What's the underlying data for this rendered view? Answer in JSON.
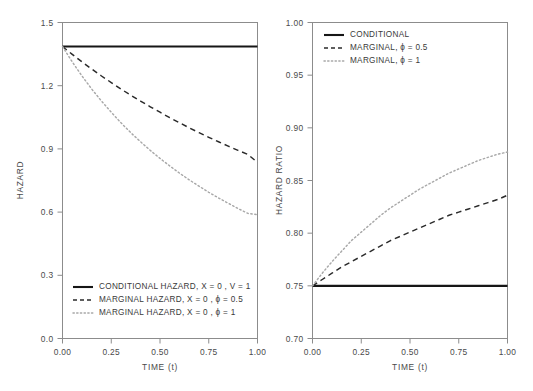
{
  "figure": {
    "background": "#ffffff",
    "panel_count": 2
  },
  "chart_data": [
    {
      "type": "line",
      "panel": "left",
      "title": "",
      "xlabel": "TIME (t)",
      "ylabel": "HAZARD",
      "xlim": [
        0,
        1
      ],
      "ylim": [
        0,
        1.5
      ],
      "xticks": [
        "0.00",
        "0.25",
        "0.50",
        "0.75",
        "1.00"
      ],
      "xtick_values": [
        0,
        0.25,
        0.5,
        0.75,
        1
      ],
      "yticks": [
        "0.0",
        "0.3",
        "0.6",
        "0.9",
        "1.2",
        "1.5"
      ],
      "ytick_values": [
        0,
        0.3,
        0.6,
        0.9,
        1.2,
        1.5
      ],
      "grid": false,
      "legend_position": "bottom-left-inside",
      "x": [
        0,
        0.05,
        0.1,
        0.15,
        0.2,
        0.25,
        0.3,
        0.35,
        0.4,
        0.45,
        0.5,
        0.55,
        0.6,
        0.65,
        0.7,
        0.75,
        0.8,
        0.85,
        0.9,
        0.95,
        1.0
      ],
      "series": [
        {
          "name": "CONDITIONAL HAZARD, X = 0 , V = 1",
          "style": "solid",
          "color": "#161616",
          "values": [
            1.386,
            1.386,
            1.386,
            1.386,
            1.386,
            1.386,
            1.386,
            1.386,
            1.386,
            1.386,
            1.386,
            1.386,
            1.386,
            1.386,
            1.386,
            1.386,
            1.386,
            1.386,
            1.386,
            1.386,
            1.386
          ]
        },
        {
          "name": "MARGINAL HAZARD, X = 0 , ϕ = 0.5",
          "style": "dashed",
          "color": "#2a2a2a",
          "values": [
            1.386,
            1.349,
            1.313,
            1.279,
            1.246,
            1.215,
            1.184,
            1.155,
            1.127,
            1.1,
            1.074,
            1.048,
            1.024,
            1.0,
            0.977,
            0.955,
            0.934,
            0.913,
            0.893,
            0.874,
            0.836
          ]
        },
        {
          "name": "MARGINAL HAZARD, X = 0 , ϕ = 1",
          "style": "dotted",
          "color": "#a8a8a8",
          "values": [
            1.386,
            1.313,
            1.246,
            1.184,
            1.127,
            1.074,
            1.024,
            0.977,
            0.934,
            0.893,
            0.855,
            0.819,
            0.785,
            0.753,
            0.723,
            0.694,
            0.667,
            0.642,
            0.617,
            0.594,
            0.588
          ]
        }
      ],
      "legend": [
        {
          "label": "CONDITIONAL HAZARD, X = 0 , V = 1",
          "style": "solid"
        },
        {
          "label": "MARGINAL HAZARD, X = 0 , ϕ = 0.5",
          "style": "dashed"
        },
        {
          "label": "MARGINAL HAZARD, X = 0 , ϕ = 1",
          "style": "dotted"
        }
      ]
    },
    {
      "type": "line",
      "panel": "right",
      "title": "",
      "xlabel": "TIME (t)",
      "ylabel": "HAZARD RATIO",
      "xlim": [
        0,
        1
      ],
      "ylim": [
        0.7,
        1.0
      ],
      "xticks": [
        "0.00",
        "0.25",
        "0.50",
        "0.75",
        "1.00"
      ],
      "xtick_values": [
        0,
        0.25,
        0.5,
        0.75,
        1
      ],
      "yticks": [
        "0.70",
        "0.75",
        "0.80",
        "0.85",
        "0.90",
        "0.95",
        "1.00"
      ],
      "ytick_values": [
        0.7,
        0.75,
        0.8,
        0.85,
        0.9,
        0.95,
        1.0
      ],
      "grid": false,
      "legend_position": "top-left-inside",
      "x": [
        0,
        0.05,
        0.1,
        0.15,
        0.2,
        0.25,
        0.3,
        0.35,
        0.4,
        0.45,
        0.5,
        0.55,
        0.6,
        0.65,
        0.7,
        0.75,
        0.8,
        0.85,
        0.9,
        0.95,
        1.0
      ],
      "series": [
        {
          "name": "CONDITIONAL",
          "style": "solid",
          "color": "#161616",
          "values": [
            0.75,
            0.75,
            0.75,
            0.75,
            0.75,
            0.75,
            0.75,
            0.75,
            0.75,
            0.75,
            0.75,
            0.75,
            0.75,
            0.75,
            0.75,
            0.75,
            0.75,
            0.75,
            0.75,
            0.75,
            0.75
          ]
        },
        {
          "name": "MARGINAL, ϕ = 0.5",
          "style": "dashed",
          "color": "#2a2a2a",
          "values": [
            0.75,
            0.756,
            0.762,
            0.768,
            0.773,
            0.778,
            0.783,
            0.788,
            0.793,
            0.797,
            0.801,
            0.805,
            0.809,
            0.813,
            0.817,
            0.82,
            0.823,
            0.826,
            0.829,
            0.832,
            0.836
          ]
        },
        {
          "name": "MARGINAL, ϕ = 1",
          "style": "dotted",
          "color": "#a8a8a8",
          "values": [
            0.75,
            0.762,
            0.773,
            0.783,
            0.793,
            0.801,
            0.809,
            0.817,
            0.824,
            0.83,
            0.836,
            0.842,
            0.847,
            0.852,
            0.857,
            0.861,
            0.865,
            0.869,
            0.872,
            0.875,
            0.877
          ]
        }
      ],
      "legend": [
        {
          "label": "CONDITIONAL",
          "style": "solid"
        },
        {
          "label": "MARGINAL, ϕ = 0.5",
          "style": "dashed"
        },
        {
          "label": "MARGINAL, ϕ = 1",
          "style": "dotted"
        }
      ]
    }
  ],
  "colors": {
    "solid": "#161616",
    "dashed": "#2a2a2a",
    "dotted": "#a8a8a8",
    "axis": "#8c8c8c",
    "text": "#3a3a3a"
  }
}
